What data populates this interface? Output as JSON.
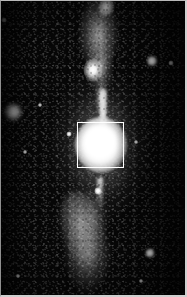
{
  "figure": {
    "kind": "astronomical-grayscale-image",
    "width_px": 187,
    "height_px": 297,
    "colormap": "grayscale",
    "background_color": "#070707",
    "frame_color": "#c8c8c8",
    "overlay_box_color": "#ffffff"
  },
  "chart_data": {
    "type": "heatmap",
    "title": "",
    "subtitle": "",
    "xlabel": "",
    "ylabel": "",
    "grid": false,
    "legend": "none",
    "colormap": "grayscale",
    "axis_ranges": {
      "x_px": [
        0,
        187
      ],
      "y_px": [
        0,
        297
      ]
    },
    "tick_labels": {
      "x": [],
      "y": []
    },
    "annotations": [
      {
        "name": "region-box",
        "shape": "rectangle",
        "x_px": 77,
        "y_px": 122,
        "width_px": 47,
        "height_px": 46,
        "stroke": "#ffffff",
        "stroke_width_px": 1,
        "fill": "none",
        "label": ""
      }
    ],
    "features": [
      {
        "name": "nucleus",
        "kind": "saturated-core",
        "x_px": 100,
        "y_px": 145,
        "peak_intensity": 255,
        "radius_px": 26
      },
      {
        "name": "upper-jet-knot",
        "kind": "jet-knot",
        "x_px": 101,
        "y_px": 70,
        "peak_intensity": 252,
        "radius_px": 10
      },
      {
        "name": "upper-lobe",
        "kind": "diffuse-lobe",
        "x_px": 98,
        "y_px": 33,
        "peak_intensity": 210,
        "radius_px": 26
      },
      {
        "name": "upper-jet-tip",
        "kind": "jet-tip",
        "x_px": 105,
        "y_px": 6,
        "peak_intensity": 235,
        "radius_px": 8
      },
      {
        "name": "lower-plume",
        "kind": "diffuse-outflow",
        "x_px": 82,
        "y_px": 232,
        "peak_intensity": 190,
        "radius_px": 30
      },
      {
        "name": "galaxy-halo",
        "kind": "diffuse-halo",
        "x_px": 100,
        "y_px": 146,
        "peak_intensity": 150,
        "radius_px": 62
      }
    ],
    "point_sources": [
      {
        "name": "star-left-fuzzy",
        "x_px": 13,
        "y_px": 112,
        "diameter_px": 16,
        "intensity": 230
      },
      {
        "name": "star-upper-right",
        "x_px": 152,
        "y_px": 61,
        "diameter_px": 10,
        "intensity": 250
      },
      {
        "name": "star-upper-right-2",
        "x_px": 171,
        "y_px": 63,
        "diameter_px": 5,
        "intensity": 210
      },
      {
        "name": "star-top-left",
        "x_px": 4,
        "y_px": 20,
        "diameter_px": 5,
        "intensity": 200
      },
      {
        "name": "star-inner-left",
        "x_px": 69,
        "y_px": 134,
        "diameter_px": 5,
        "intensity": 235
      },
      {
        "name": "star-mid-left",
        "x_px": 40,
        "y_px": 105,
        "diameter_px": 4,
        "intensity": 195
      },
      {
        "name": "star-lower-left",
        "x_px": 25,
        "y_px": 152,
        "diameter_px": 4,
        "intensity": 200
      },
      {
        "name": "star-below-core",
        "x_px": 98,
        "y_px": 191,
        "diameter_px": 7,
        "intensity": 245
      },
      {
        "name": "star-bottom-right",
        "x_px": 150,
        "y_px": 253,
        "diameter_px": 9,
        "intensity": 252
      },
      {
        "name": "star-bottom-right-2",
        "x_px": 141,
        "y_px": 281,
        "diameter_px": 4,
        "intensity": 190
      },
      {
        "name": "star-bottom-left",
        "x_px": 18,
        "y_px": 276,
        "diameter_px": 4,
        "intensity": 185
      },
      {
        "name": "star-right-mid",
        "x_px": 136,
        "y_px": 142,
        "diameter_px": 4,
        "intensity": 205
      }
    ]
  }
}
